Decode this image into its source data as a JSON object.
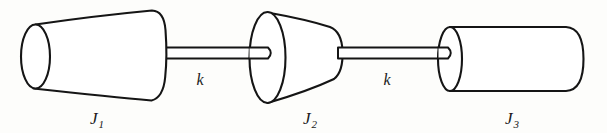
{
  "figure": {
    "background_color": "#fdfdfb",
    "line_color": "#151515",
    "fill_color": "#ffffff"
  },
  "bodies": [
    {
      "id": "J1",
      "symbol": "J",
      "subscript": "1",
      "shape": "truncated-cone",
      "orientation": "small-face-left",
      "label_x": 97,
      "label_y": 124
    },
    {
      "id": "J2",
      "symbol": "J",
      "subscript": "2",
      "shape": "truncated-cone",
      "orientation": "large-face-left",
      "label_x": 310,
      "label_y": 124
    },
    {
      "id": "J3",
      "symbol": "J",
      "subscript": "3",
      "shape": "cylinder",
      "orientation": "flat-face-left",
      "label_x": 512,
      "label_y": 124
    }
  ],
  "shafts": [
    {
      "id": "shaft-1",
      "label": "k",
      "connects": [
        "J1",
        "J2"
      ],
      "label_x": 200,
      "label_y": 85
    },
    {
      "id": "shaft-2",
      "label": "k",
      "connects": [
        "J2",
        "J3"
      ],
      "label_x": 387,
      "label_y": 85
    }
  ]
}
